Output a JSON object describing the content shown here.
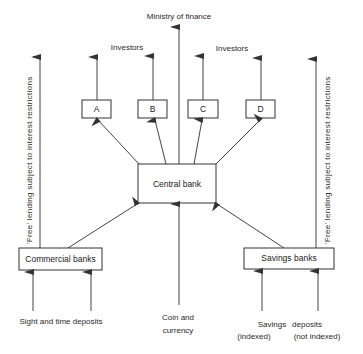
{
  "diagram": {
    "title_top": "Ministry of finance",
    "investors_left": "Investors",
    "investors_right": "Investors",
    "boxes": {
      "a": "A",
      "b": "B",
      "c": "C",
      "d": "D",
      "central": "Central bank",
      "commercial": "Commercial banks",
      "savings": "Savings banks"
    },
    "side_labels": {
      "left": "'Free' lending subject to interest restrictions",
      "right": "'Free' lending subject to interest restrictions"
    },
    "bottom_labels": {
      "sight_time": "Sight and time deposits",
      "coin_line1": "Coin and",
      "coin_line2": "currency",
      "savings_deposits_a": "Savings",
      "savings_deposits_b": "deposits",
      "indexed": "(indexed)",
      "not_indexed": "(not indexed)"
    },
    "colors": {
      "line": "#444444",
      "text": "#2a2a2a",
      "background": "#ffffff"
    }
  }
}
